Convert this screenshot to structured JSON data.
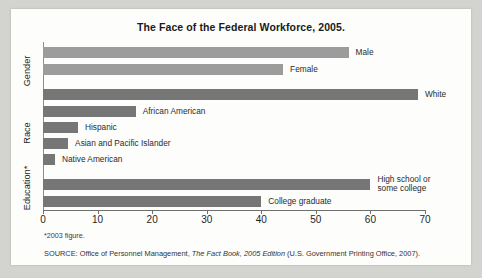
{
  "chart_data": {
    "type": "bar",
    "orientation": "horizontal",
    "title": "The Face of the Federal Workforce, 2005.",
    "xlabel": "",
    "ylabel": "",
    "xlim": [
      0,
      70
    ],
    "xticks": [
      0,
      10,
      20,
      30,
      40,
      50,
      60,
      70
    ],
    "grid": false,
    "legend": "none",
    "groups": [
      {
        "name": "Gender",
        "label": "Gender",
        "color": "#9c9c9c",
        "bars": [
          {
            "label": "Male",
            "value": 56.0
          },
          {
            "label": "Female",
            "value": 44.0
          }
        ]
      },
      {
        "name": "Race",
        "label": "Race",
        "color": "#767676",
        "bars": [
          {
            "label": "White",
            "value": 68.7
          },
          {
            "label": "African American",
            "value": 17.0
          },
          {
            "label": "Hispanic",
            "value": 6.4
          },
          {
            "label": "Asian and Pacific Islander",
            "value": 4.6
          },
          {
            "label": "Native American",
            "value": 2.2
          }
        ]
      },
      {
        "name": "Education",
        "label": "Education*",
        "color": "#767676",
        "bars": [
          {
            "label": "High school or some college",
            "value": 60.0,
            "two_line": true
          },
          {
            "label": "College graduate",
            "value": 40.0
          }
        ]
      }
    ],
    "categories": [
      "Male",
      "Female",
      "White",
      "African American",
      "Hispanic",
      "Asian and Pacific Islander",
      "Native American",
      "High school or some college",
      "College graduate"
    ],
    "values": [
      56.0,
      44.0,
      68.7,
      17.0,
      6.4,
      4.6,
      2.2,
      60.0,
      40.0
    ],
    "footnote": "*2003 figure.",
    "source_prefix": "SOURCE: Office of Personnel Management, ",
    "source_italic": "The Fact Book, 2005 Edition",
    "source_suffix": " (U.S. Government Printing Office, 2007)."
  },
  "colors": {
    "bar_light": "#9c9c9c",
    "bar_dark": "#767676",
    "axis": "#6f6f6f",
    "panel": "#fdfdfc",
    "backdrop": "#d3d3d0",
    "text": "#1f1f1f"
  }
}
